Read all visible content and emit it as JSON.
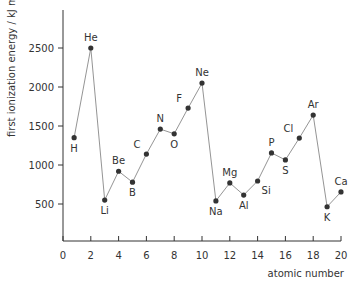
{
  "chart_data": {
    "type": "line",
    "title": "",
    "xlabel": "atomic number",
    "ylabel": "first ionization energy / kJ mol⁻¹",
    "xlim": [
      0,
      20
    ],
    "ylim": [
      0,
      2900
    ],
    "xticks": [
      0,
      2,
      4,
      6,
      8,
      10,
      12,
      14,
      16,
      18,
      20
    ],
    "yticks": [
      500,
      1000,
      1500,
      2000,
      2500
    ],
    "grid": false,
    "legend": null,
    "series": [
      {
        "name": "first ionization energy",
        "color": "#888888",
        "marker_color": "#333333",
        "points": [
          {
            "element": "H",
            "x": 0.8,
            "y": 1350,
            "label_pos": "below"
          },
          {
            "element": "He",
            "x": 2,
            "y": 2500,
            "label_pos": "above"
          },
          {
            "element": "Li",
            "x": 3,
            "y": 550,
            "label_pos": "below"
          },
          {
            "element": "Be",
            "x": 4,
            "y": 920,
            "label_pos": "above"
          },
          {
            "element": "B",
            "x": 5,
            "y": 780,
            "label_pos": "below"
          },
          {
            "element": "C",
            "x": 6,
            "y": 1140,
            "label_pos": "above-left"
          },
          {
            "element": "N",
            "x": 7,
            "y": 1460,
            "label_pos": "above"
          },
          {
            "element": "O",
            "x": 8,
            "y": 1400,
            "label_pos": "below"
          },
          {
            "element": "F",
            "x": 9,
            "y": 1730,
            "label_pos": "above-left"
          },
          {
            "element": "Ne",
            "x": 10,
            "y": 2050,
            "label_pos": "above"
          },
          {
            "element": "Na",
            "x": 11,
            "y": 540,
            "label_pos": "below"
          },
          {
            "element": "Mg",
            "x": 12,
            "y": 770,
            "label_pos": "above"
          },
          {
            "element": "Al",
            "x": 13,
            "y": 615,
            "label_pos": "below"
          },
          {
            "element": "Si",
            "x": 14,
            "y": 795,
            "label_pos": "below-right"
          },
          {
            "element": "P",
            "x": 15,
            "y": 1155,
            "label_pos": "above"
          },
          {
            "element": "S",
            "x": 16,
            "y": 1065,
            "label_pos": "below"
          },
          {
            "element": "Cl",
            "x": 17,
            "y": 1345,
            "label_pos": "above-left"
          },
          {
            "element": "Ar",
            "x": 18,
            "y": 1640,
            "label_pos": "above"
          },
          {
            "element": "K",
            "x": 19,
            "y": 465,
            "label_pos": "below"
          },
          {
            "element": "Ca",
            "x": 20,
            "y": 655,
            "label_pos": "above"
          }
        ]
      }
    ]
  },
  "axes": {
    "x_title": "atomic number",
    "y_title": "first ionization energy / kJ mol⁻¹"
  }
}
